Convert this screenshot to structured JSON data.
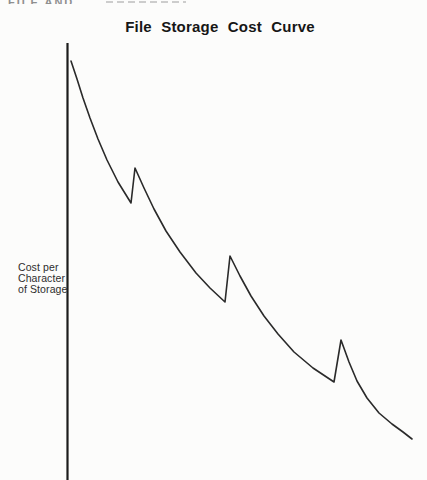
{
  "page": {
    "cropped_header_fragment": "FILE AND",
    "background": "#fcfcfb"
  },
  "chart": {
    "title": "File Storage Cost Curve",
    "y_axis_label_lines": [
      "Cost per",
      "Character",
      "of Storage"
    ]
  },
  "chart_data": {
    "type": "line",
    "title": "File Storage Cost Curve",
    "xlabel": "",
    "ylabel": "Cost per Character of Storage",
    "x_axis": {
      "line_visible": false,
      "ticks": [],
      "numeric_labels": false
    },
    "y_axis": {
      "line_visible": true,
      "ticks": [],
      "numeric_labels": false
    },
    "grid": false,
    "legend": null,
    "line_color": "#2a2a2a",
    "axis_color": "#1c1c1c",
    "axis_px": {
      "x": 67.5,
      "y_top": 43,
      "y_bottom": 481
    },
    "series": [
      {
        "name": "cost-per-character-curve",
        "points_px": [
          [
            71,
            61
          ],
          [
            77,
            79
          ],
          [
            83,
            98
          ],
          [
            90,
            118
          ],
          [
            98,
            139
          ],
          [
            107,
            160
          ],
          [
            118,
            182
          ],
          [
            131,
            203
          ],
          [
            135,
            168
          ],
          [
            144,
            188
          ],
          [
            154,
            209
          ],
          [
            166,
            231
          ],
          [
            180,
            252
          ],
          [
            196,
            273
          ],
          [
            210,
            288
          ],
          [
            225,
            302
          ],
          [
            230,
            256
          ],
          [
            240,
            276
          ],
          [
            251,
            296
          ],
          [
            264,
            316
          ],
          [
            278,
            334
          ],
          [
            294,
            352
          ],
          [
            313,
            368
          ],
          [
            334,
            382
          ],
          [
            341,
            340
          ],
          [
            349,
            362
          ],
          [
            357,
            381
          ],
          [
            367,
            398
          ],
          [
            379,
            413
          ],
          [
            392,
            424
          ],
          [
            403,
            432
          ],
          [
            412,
            439
          ]
        ]
      }
    ]
  }
}
